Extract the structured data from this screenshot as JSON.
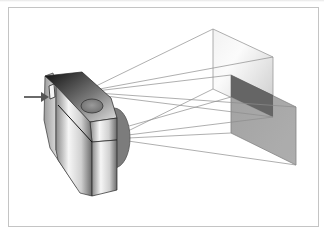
{
  "figure": {
    "colors": {
      "background": "#ffffff",
      "frame_border": "#c4c4c4",
      "ray_line": "#8c8c8c",
      "far_plane_fill": "#d6d6d6",
      "near_plane_fill": "#8e8e8e",
      "overlap_fill": "#585858",
      "lens_fill": "#7a7a7a",
      "camera_dark": "#1e1e1e",
      "camera_light": "#f4f4f4",
      "arrow": "#6a6a6a"
    },
    "elements": [
      {
        "name": "camera-body",
        "description": "3D shaded camera body with viewfinder on the left side"
      },
      {
        "name": "lens-disk",
        "description": "Dark grey circular lens on the front of the camera"
      },
      {
        "name": "shutter-button",
        "description": "Oval button on the top of the camera"
      },
      {
        "name": "indicator-arrow",
        "description": "Grey arrow pointing into the viewfinder"
      },
      {
        "name": "far-image-plane",
        "description": "Light translucent rectangular plane at the far end of the frustum"
      },
      {
        "name": "near-image-plane",
        "description": "Darker translucent rectangular plane intersecting the far plane"
      },
      {
        "name": "projection-rays",
        "description": "Thin lines from the lens to plane corners"
      }
    ]
  }
}
